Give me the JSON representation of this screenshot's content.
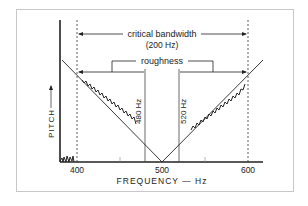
{
  "figure": {
    "labels": {
      "critical_bandwidth": "critical bandwidth",
      "critical_bandwidth_value": "(200 Hz)",
      "roughness": "roughness",
      "line_480": "480 Hz",
      "line_520": "520 Hz",
      "y_axis": "PITCH",
      "x_axis": "FREQUENCY — Hz"
    },
    "x_ticks": [
      "400",
      "500",
      "600"
    ],
    "colors": {
      "ink": "#222222",
      "frame": "#c8c8c8",
      "background": "#ffffff"
    }
  }
}
